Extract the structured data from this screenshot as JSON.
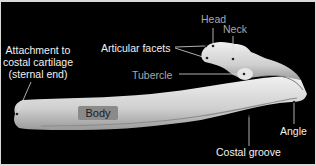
{
  "figure": {
    "background_color": "#000000",
    "border_color": "#d9d9d9",
    "bone_color": "#dcdcdc"
  },
  "labels": {
    "attachment_line1": "Attachment to",
    "attachment_line2": "costal cartilage",
    "attachment_line3": "(sternal end)",
    "articular_facets": "Articular facets",
    "head": "Head",
    "neck": "Neck",
    "tubercle": "Tubercle",
    "body": "Body",
    "angle": "Angle",
    "costal_groove": "Costal groove"
  },
  "label_colors": {
    "primary": "#f2f2f2",
    "secondary": "#a8a8a8"
  }
}
